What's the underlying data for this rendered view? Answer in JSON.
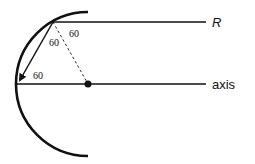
{
  "diagram": {
    "labels": {
      "ray_label": "R",
      "axis_label": "axis",
      "angle_top": "60",
      "angle_middle": "60",
      "angle_bottom": "60"
    },
    "colors": {
      "stroke": "#111111",
      "background": "#ffffff"
    }
  }
}
